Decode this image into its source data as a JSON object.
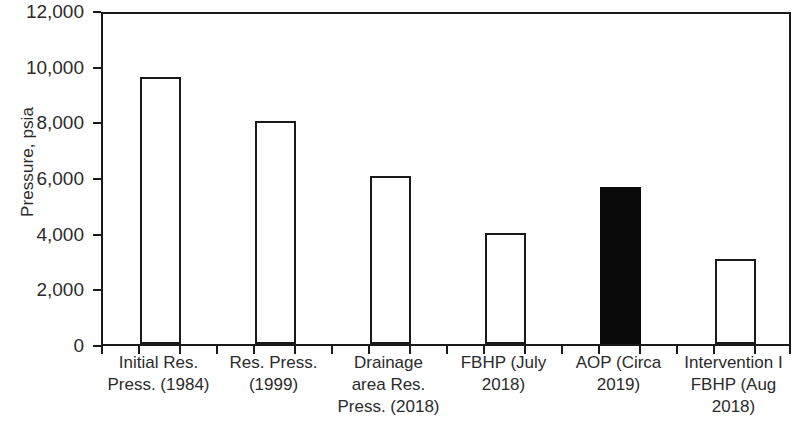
{
  "chart_data": {
    "type": "bar",
    "title": "",
    "xlabel": "",
    "ylabel": "Pressure, psia",
    "categories": [
      "Initial Res. Press. (1984)",
      "Res. Press. (1999)",
      "Drainage area Res. Press. (2018)",
      "FBHP (July 2018)",
      "AOP (Circa 2019)",
      "Intervention I FBHP (Aug 2018)"
    ],
    "category_lines": [
      [
        "Initial Res.",
        "Press. (1984)"
      ],
      [
        "Res. Press.",
        "(1999)"
      ],
      [
        "Drainage",
        "area Res.",
        "Press. (2018)"
      ],
      [
        "FBHP (July",
        "2018)"
      ],
      [
        "AOP (Circa",
        "2019)"
      ],
      [
        "Intervention I",
        "FBHP (Aug",
        "2018)"
      ]
    ],
    "values": [
      9600,
      8000,
      6050,
      4000,
      5650,
      3050
    ],
    "bar_styles": [
      "open",
      "open",
      "open",
      "open",
      "filled",
      "open"
    ],
    "highlight_index": 4,
    "ylim": [
      0,
      12000
    ],
    "ytick_values": [
      0,
      2000,
      4000,
      6000,
      8000,
      10000,
      12000
    ],
    "ytick_labels": [
      "0",
      "2,000",
      "4,000",
      "6,000",
      "8,000",
      "10,000",
      "12,000"
    ],
    "grid": false,
    "legend": "none",
    "colors": {
      "axis": "#1a1a1a",
      "text": "#2b2b2b",
      "bar_open_fill": "#ffffff",
      "bar_open_stroke": "#1a1a1a",
      "bar_filled": "#0a0a0a",
      "background": "#ffffff"
    }
  }
}
